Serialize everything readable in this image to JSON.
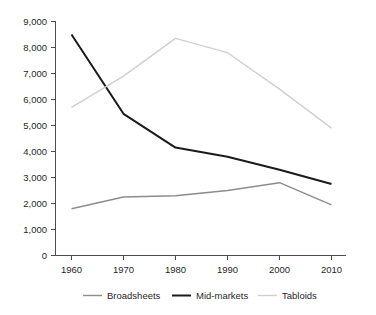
{
  "chart_data": {
    "type": "line",
    "title": "",
    "subtitle": "",
    "xlabel": "",
    "ylabel": "",
    "x": [
      1960,
      1970,
      1980,
      1990,
      2000,
      2010
    ],
    "categories": [
      "1960",
      "1970",
      "1980",
      "1990",
      "2000",
      "2010"
    ],
    "series": [
      {
        "name": "Broadsheets",
        "color": "#8c8c8c",
        "values": [
          1800,
          2250,
          2300,
          2500,
          2800,
          1950
        ]
      },
      {
        "name": "Mid-markets",
        "color": "#1a1a1a",
        "values": [
          8500,
          5450,
          4150,
          3800,
          3300,
          2750
        ]
      },
      {
        "name": "Tabloids",
        "color": "#cfcfcf",
        "values": [
          5700,
          6900,
          8350,
          7800,
          6400,
          4900
        ]
      }
    ],
    "ylim": [
      0,
      9000
    ],
    "ytick_values": [
      0,
      1000,
      2000,
      3000,
      4000,
      5000,
      6000,
      7000,
      8000,
      9000
    ],
    "ytick_labels": [
      "0",
      "1,000",
      "2,000",
      "3,000",
      "4,000",
      "5,000",
      "6,000",
      "7,000",
      "8,000",
      "9,000"
    ],
    "xtick_labels": [
      "1960",
      "1970",
      "1980",
      "1990",
      "2000",
      "2010"
    ],
    "grid": false,
    "legend_position": "bottom"
  },
  "axes": {
    "y_labels": {
      "y0": "0",
      "y1": "1,000",
      "y2": "2,000",
      "y3": "3,000",
      "y4": "4,000",
      "y5": "5,000",
      "y6": "6,000",
      "y7": "7,000",
      "y8": "8,000",
      "y9": "9,000"
    },
    "x_labels": {
      "x0": "1960",
      "x1": "1970",
      "x2": "1980",
      "x3": "1990",
      "x4": "2000",
      "x5": "2010"
    }
  },
  "legend": {
    "items": [
      {
        "label": "Broadsheets",
        "color": "#8c8c8c"
      },
      {
        "label": "Mid-markets",
        "color": "#1a1a1a"
      },
      {
        "label": "Tabloids",
        "color": "#cfcfcf"
      }
    ]
  }
}
